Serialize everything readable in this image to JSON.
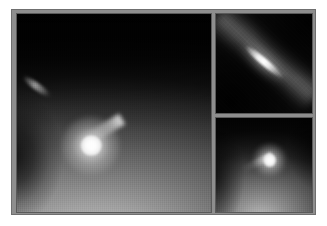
{
  "figure": {
    "colormap": "grayscale",
    "background_color": "#ffffff",
    "frame_color": "#8e8e8e",
    "frame_border_color": "#6f6f6f",
    "panel_border_color": "#5a5a5a",
    "panel_count": 3,
    "layout": "one large panel at left, two stacked detail panels at right"
  },
  "panels": [
    {
      "id": "main",
      "name": "wide-field-panel",
      "position": "left",
      "background_color": "#0a0a0a",
      "description": "Wide-field grayscale frame: dark sky at top fading into a large bright diffuse coma filling the lower half, with a bright unresolved nucleus left of center and a narrow jet extending toward the upper left.",
      "features": [
        {
          "name": "nucleus",
          "type": "point-source",
          "x_pct": 38.3,
          "y_pct": 66.5,
          "peak_color": "#ffffff",
          "label": "bright saturated nucleus"
        },
        {
          "name": "jet",
          "type": "linear-streak",
          "angle_deg": -31,
          "length_pct": 34,
          "label": "jet extending up-left from nucleus"
        },
        {
          "name": "companion-streak",
          "type": "elongated-streak",
          "x_pct": 12,
          "y_pct": 32,
          "angle_deg": 36,
          "label": "faint elongated feature upper-left"
        },
        {
          "name": "coma",
          "type": "diffuse-glow",
          "label": "broad diffuse coma brightening toward bottom"
        },
        {
          "name": "dark-wedge",
          "type": "shadow",
          "label": "dark wedge along lower-left edge"
        }
      ]
    },
    {
      "id": "detail-top",
      "name": "detail-panel-upper-right",
      "position": "upper right",
      "background_color": "#070707",
      "description": "Zoomed detail: a sharply elongated, needle-like bright source oriented diagonally from upper-left to lower-right, embedded in a broad diagonal nebular band with dark lanes at lower-left and upper-right.",
      "features": [
        {
          "name": "elongated-nucleus",
          "type": "linear-streak",
          "x_pct": 50,
          "y_pct": 48,
          "angle_deg": 40,
          "length_pct": 52,
          "peak_color": "#ffffff",
          "label": "resolved elongated nucleus"
        },
        {
          "name": "nebular-band",
          "type": "diffuse-band",
          "angle_deg": 40,
          "label": "diagonal nebular band"
        },
        {
          "name": "dark-lane",
          "type": "shadow",
          "label": "dark lane lower-left"
        }
      ]
    },
    {
      "id": "detail-bottom",
      "name": "detail-panel-lower-right",
      "position": "lower right",
      "background_color": "#0a0a0a",
      "description": "Zoomed detail: compact bright nucleus slightly right of center with a short jet to the upper left, surrounded by a smooth diffuse coma brightening toward the bottom.",
      "features": [
        {
          "name": "nucleus",
          "type": "point-source",
          "x_pct": 56,
          "y_pct": 45,
          "peak_color": "#ffffff",
          "label": "compact bright nucleus"
        },
        {
          "name": "jet",
          "type": "linear-streak",
          "angle_deg": -26,
          "length_pct": 34,
          "label": "short jet toward upper left"
        },
        {
          "name": "coma",
          "type": "diffuse-glow",
          "label": "smooth coma brightening downward"
        }
      ]
    }
  ]
}
